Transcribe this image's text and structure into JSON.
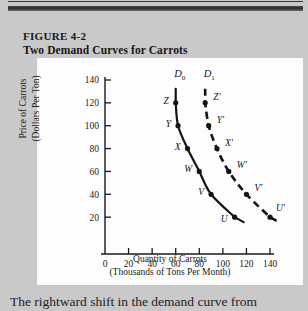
{
  "figure": {
    "number": "FIGURE 4-2",
    "title": "Two Demand Curves for Carrots"
  },
  "caption": {
    "text": "The rightward shift in the demand curve from"
  },
  "chart_data": {
    "type": "line",
    "title": "Two Demand Curves for Carrots",
    "xlabel": "Quantity of Carrots",
    "xlabel_sub": "(Thousands of Tons Per Month)",
    "ylabel": "Price of Carrots",
    "ylabel_sub": "(Dollars Per Ton)",
    "xlim": [
      0,
      140
    ],
    "ylim": [
      0,
      140
    ],
    "xticks": [
      "0",
      "20",
      "40",
      "60",
      "80",
      "100",
      "120",
      "140"
    ],
    "yticks": [
      "20",
      "40",
      "60",
      "80",
      "100",
      "120",
      "140"
    ],
    "grid": false,
    "legend": "inline-curve-labels",
    "series": [
      {
        "name": "D0",
        "label": "D",
        "label_sub": "0",
        "style": "solid",
        "points": [
          {
            "label": "Z",
            "x": 60,
            "y": 120
          },
          {
            "label": "Y",
            "x": 62,
            "y": 100
          },
          {
            "label": "X",
            "x": 70,
            "y": 80
          },
          {
            "label": "W",
            "x": 80,
            "y": 60
          },
          {
            "label": "V",
            "x": 90,
            "y": 40
          },
          {
            "label": "U",
            "x": 110,
            "y": 20
          }
        ]
      },
      {
        "name": "D1",
        "label": "D",
        "label_sub": "1",
        "style": "dashed",
        "points": [
          {
            "label": "Z'",
            "x": 85,
            "y": 120
          },
          {
            "label": "Y'",
            "x": 88,
            "y": 100
          },
          {
            "label": "X'",
            "x": 95,
            "y": 80
          },
          {
            "label": "W'",
            "x": 105,
            "y": 60
          },
          {
            "label": "V'",
            "x": 120,
            "y": 40
          },
          {
            "label": "U'",
            "x": 140,
            "y": 20
          }
        ]
      }
    ]
  }
}
